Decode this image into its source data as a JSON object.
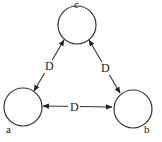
{
  "diagram": {
    "type": "graph",
    "nodes": [
      {
        "id": "c",
        "label": "c",
        "cx": 77,
        "cy": 25,
        "r": 19,
        "lx": 74,
        "ly": 8
      },
      {
        "id": "a",
        "label": "a",
        "cx": 23,
        "cy": 107,
        "r": 19,
        "lx": 6,
        "ly": 133
      },
      {
        "id": "b",
        "label": "b",
        "cx": 133,
        "cy": 109,
        "r": 19,
        "lx": 144,
        "ly": 133
      }
    ],
    "edges": [
      {
        "from": "c",
        "to": "a",
        "label": "D",
        "bidirectional": true,
        "x1": 64,
        "y1": 40,
        "x2": 34,
        "y2": 91,
        "lx": 45,
        "ly": 70
      },
      {
        "from": "c",
        "to": "b",
        "label": "D",
        "bidirectional": true,
        "x1": 89,
        "y1": 40,
        "x2": 120,
        "y2": 93,
        "lx": 101,
        "ly": 72
      },
      {
        "from": "a",
        "to": "b",
        "label": "D",
        "bidirectional": true,
        "x1": 43,
        "y1": 106,
        "x2": 112,
        "y2": 107,
        "lx": 70,
        "ly": 111
      }
    ]
  }
}
